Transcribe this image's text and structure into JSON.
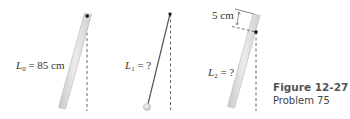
{
  "figure": {
    "panels": [
      {
        "id": "panel-0",
        "object": "uniform rod pivoted at top end",
        "label_symbol": "L",
        "label_subscript": "0",
        "label_rest": " = 85 cm"
      },
      {
        "id": "panel-1",
        "object": "simple pendulum (string and bob)",
        "label_symbol": "L",
        "label_subscript": "1",
        "label_rest": " = ?"
      },
      {
        "id": "panel-2",
        "object": "uniform rod pivoted below top end",
        "label_symbol": "L",
        "label_subscript": "2",
        "label_rest": " = ?",
        "offset_label": "5 cm"
      }
    ],
    "caption": {
      "title": "Figure 12-27",
      "subtitle": "Problem 75"
    },
    "colors": {
      "rod_fill": "#d9d9d9",
      "rod_edge": "#b8b8b8",
      "pivot": "#111111",
      "dashed": "#555555",
      "string": "#555555",
      "bob": "#d8d8d8",
      "text": "#333333"
    }
  }
}
